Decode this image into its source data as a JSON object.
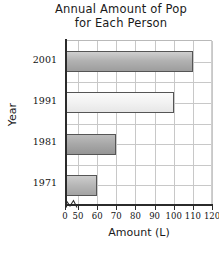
{
  "chart_data": {
    "type": "bar",
    "orientation": "horizontal",
    "title_line1": "Annual Amount of Pop",
    "title_line2": "for Each Person",
    "xlabel": "Amount (L)",
    "ylabel": "Year",
    "categories": [
      "2001",
      "1991",
      "1981",
      "1971"
    ],
    "values": [
      110,
      100,
      70,
      60
    ],
    "bars": [
      {
        "category": "2001",
        "value": 110,
        "fill": "#b2b2b2"
      },
      {
        "category": "1991",
        "value": 100,
        "fill": "#f2f2f2"
      },
      {
        "category": "1981",
        "value": 70,
        "fill": "#a7a7a7"
      },
      {
        "category": "1971",
        "value": 60,
        "fill": "#b6b6b6"
      }
    ],
    "xlim": [
      50,
      120
    ],
    "x_axis_break": true,
    "x_axis_break_note": "axis break between 0 and 50",
    "xticks": [
      0,
      50,
      60,
      70,
      80,
      90,
      100,
      110,
      120
    ],
    "xtick_labels": [
      "0",
      "50",
      "60",
      "70",
      "80",
      "90",
      "100",
      "110",
      "120"
    ],
    "ytick_labels": [
      "2001",
      "1991",
      "1981",
      "1971"
    ],
    "grid": true,
    "legend": false,
    "axis_color": "#2b2b2b",
    "grid_color": "#c8c8c8",
    "background": "#ffffff"
  }
}
